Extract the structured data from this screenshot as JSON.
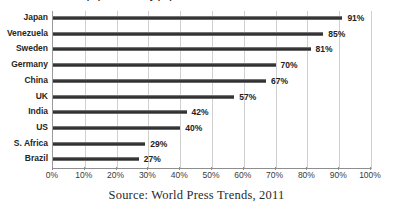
{
  "chart_data": {
    "type": "bar",
    "orientation": "horizontal",
    "title": "",
    "xlabel": "",
    "ylabel": "",
    "xlim": [
      0,
      100
    ],
    "xticks": [
      "0%",
      "10%",
      "20%",
      "30%",
      "40%",
      "50%",
      "60%",
      "70%",
      "80%",
      "90%",
      "100%"
    ],
    "xtick_values": [
      0,
      10,
      20,
      30,
      40,
      50,
      60,
      70,
      80,
      90,
      100
    ],
    "grid": "vertical",
    "legend": "none",
    "categories": [
      "Japan",
      "Venezuela",
      "Sweden",
      "Germany",
      "China",
      "UK",
      "India",
      "US",
      "S. Africa",
      "Brazil"
    ],
    "values": [
      91,
      85,
      81,
      70,
      67,
      57,
      42,
      40,
      29,
      27
    ],
    "data_labels": [
      "91%",
      "85%",
      "81%",
      "70%",
      "67%",
      "57%",
      "42%",
      "40%",
      "29%",
      "27%"
    ],
    "bar_color": "#1f1f1f",
    "gridline_color": "#d0d0d0",
    "axis_color": "#8e8e8e"
  },
  "caption": {
    "source_text": "Source: World Press Trends, 2011"
  },
  "clipped_title": {
    "text": "Newspapers read by population"
  }
}
